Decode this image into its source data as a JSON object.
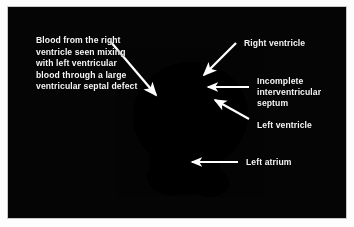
{
  "figure": {
    "type": "echocardiogram",
    "modality": "2D echocardiography still frame",
    "background_color": "#050505",
    "frame_border_color": "#c9c9c9",
    "label_color": "#f4f4f4",
    "arrow_color": "#ffffff"
  },
  "annotations": {
    "vsd": {
      "label": "Blood from the right ventricle seen mixing with left ventricular blood through a large ventricular septal defect",
      "arrow": "arrow-vsd",
      "position": "left"
    },
    "right_ventricle": {
      "label": "Right ventricle",
      "arrow": "arrow-right-ventricle",
      "position": "top-right"
    },
    "septum": {
      "label": "Incomplete interventricular septum",
      "arrow": "arrow-septum",
      "position": "right"
    },
    "left_ventricle": {
      "label": "Left ventricle",
      "arrow": "arrow-left-ventricle",
      "position": "right"
    },
    "left_atrium": {
      "label": "Left atrium",
      "arrow": "arrow-left-atrium",
      "position": "bottom-right"
    }
  },
  "chart_data": {
    "type": "heatmap",
    "xlabel": "",
    "ylabel": "",
    "structures": [
      {
        "name": "Right ventricle",
        "appearance": "dark chamber, upper left of cardiac mass"
      },
      {
        "name": "Incomplete interventricular septum",
        "appearance": "bright echogenic band, mid-right"
      },
      {
        "name": "Left ventricle",
        "appearance": "mid-gray chamber, right of septum"
      },
      {
        "name": "Left atrium",
        "appearance": "bright white region, inferior"
      },
      {
        "name": "Ventricular septal defect",
        "appearance": "bright blood mixing jet, central"
      }
    ]
  }
}
